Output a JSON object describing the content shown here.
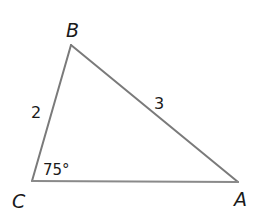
{
  "diagram": {
    "type": "triangle",
    "stroke_color": "#7a7a7a",
    "vertices": {
      "A": {
        "label": "A",
        "x": 238,
        "y": 182
      },
      "B": {
        "label": "B",
        "x": 71,
        "y": 45
      },
      "C": {
        "label": "C",
        "x": 32,
        "y": 181
      }
    },
    "sides": {
      "BC": {
        "label": "2"
      },
      "AB": {
        "label": "3"
      },
      "CA": {
        "label": ""
      }
    },
    "angles": {
      "C": {
        "label": "75°"
      }
    }
  }
}
